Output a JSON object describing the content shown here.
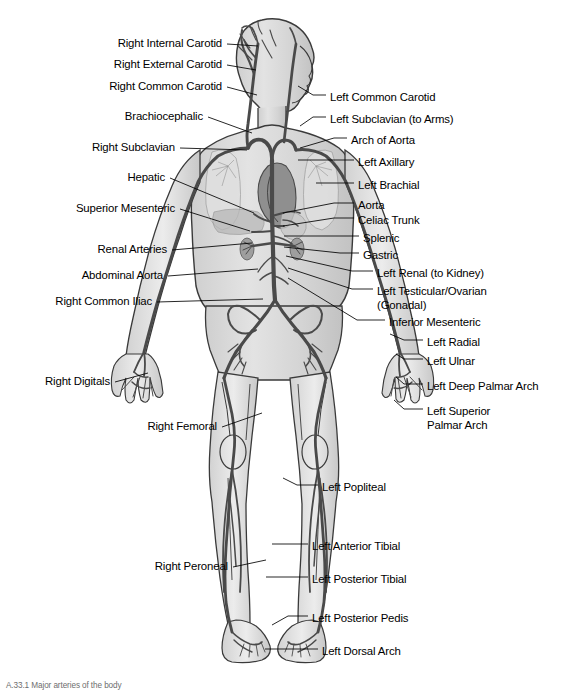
{
  "figure": {
    "caption": "A.33.1 Major arteries of the body",
    "colors": {
      "background": "#ffffff",
      "body_fill": "#d8d8d8",
      "body_fill_light": "#e8e8e8",
      "body_outline": "#3a3a3a",
      "artery": "#4a4a4a",
      "artery_dark": "#333333",
      "heart": "#8a8a8a",
      "leader_line": "#000000",
      "text": "#000000"
    }
  },
  "labels_left": [
    {
      "id": "right-internal-carotid",
      "text": "Right Internal Carotid",
      "x": 222,
      "y": 37,
      "lead_x2": 258,
      "lead_y2": 46
    },
    {
      "id": "right-external-carotid",
      "text": "Right External Carotid",
      "x": 222,
      "y": 58,
      "lead_x2": 256,
      "lead_y2": 70
    },
    {
      "id": "right-common-carotid",
      "text": "Right Common Carotid",
      "x": 222,
      "y": 80,
      "lead_x2": 257,
      "lead_y2": 95
    },
    {
      "id": "brachiocephalic",
      "text": "Brachiocephalic",
      "x": 203,
      "y": 110,
      "lead_x2": 252,
      "lead_y2": 133
    },
    {
      "id": "right-subclavian",
      "text": "Right Subclavian",
      "x": 175,
      "y": 141,
      "lead_x2": 247,
      "lead_y2": 150
    },
    {
      "id": "hepatic",
      "text": "Hepatic",
      "x": 165,
      "y": 171,
      "lead_x2": 254,
      "lead_y2": 213
    },
    {
      "id": "superior-mesenteric",
      "text": "Superior Mesenteric",
      "x": 175,
      "y": 202,
      "lead_x2": 250,
      "lead_y2": 231
    },
    {
      "id": "renal-arteries",
      "text": "Renal Arteries",
      "x": 167,
      "y": 243,
      "lead_x2": 252,
      "lead_y2": 243
    },
    {
      "id": "abdominal-aorta",
      "text": "Abdominal Aorta",
      "x": 163,
      "y": 269,
      "lead_x2": 258,
      "lead_y2": 269
    },
    {
      "id": "right-common-iliac",
      "text": "Right Common Iliac",
      "x": 152,
      "y": 295,
      "lead_x2": 263,
      "lead_y2": 299
    },
    {
      "id": "right-digitals",
      "text": "Right Digitals",
      "x": 110,
      "y": 375,
      "lead_x2": 148,
      "lead_y2": 373
    },
    {
      "id": "right-femoral",
      "text": "Right Femoral",
      "x": 217,
      "y": 420,
      "lead_x2": 262,
      "lead_y2": 413
    },
    {
      "id": "right-peroneal",
      "text": "Right Peroneal",
      "x": 228,
      "y": 560,
      "lead_x2": 266,
      "lead_y2": 560
    }
  ],
  "labels_right": [
    {
      "id": "left-common-carotid",
      "text": "Left Common Carotid",
      "x": 330,
      "y": 91,
      "lead_x1": 313,
      "lead_y1": 95,
      "anchor_x": 298,
      "anchor_y": 86
    },
    {
      "id": "left-subclavian",
      "text": "Left Subclavian (to Arms)",
      "x": 330,
      "y": 113,
      "lead_x1": 313,
      "lead_y1": 117,
      "anchor_x": 300,
      "anchor_y": 126
    },
    {
      "id": "arch-of-aorta",
      "text": "Arch of Aorta",
      "x": 351,
      "y": 134,
      "lead_x1": 334,
      "lead_y1": 138,
      "anchor_x": 300,
      "anchor_y": 148
    },
    {
      "id": "left-axillary",
      "text": "Left Axillary",
      "x": 358,
      "y": 156,
      "lead_x1": 328,
      "lead_y1": 160,
      "anchor_x": 298,
      "anchor_y": 160
    },
    {
      "id": "left-brachial",
      "text": "Left Brachial",
      "x": 358,
      "y": 179,
      "lead_x1": 334,
      "lead_y1": 183,
      "anchor_x": 316,
      "anchor_y": 183
    },
    {
      "id": "aorta",
      "text": "Aorta",
      "x": 358,
      "y": 199,
      "lead_x1": 334,
      "lead_y1": 203,
      "anchor_x": 283,
      "anchor_y": 213
    },
    {
      "id": "celiac-trunk",
      "text": "Celiac Trunk",
      "x": 358,
      "y": 214,
      "lead_x1": 334,
      "lead_y1": 218,
      "anchor_x": 283,
      "anchor_y": 226
    },
    {
      "id": "splenic",
      "text": "Splenic",
      "x": 363,
      "y": 232,
      "lead_x1": 340,
      "lead_y1": 236,
      "anchor_x": 284,
      "anchor_y": 236
    },
    {
      "id": "gastric",
      "text": "Gastric",
      "x": 363,
      "y": 249,
      "lead_x1": 340,
      "lead_y1": 253,
      "anchor_x": 284,
      "anchor_y": 247
    },
    {
      "id": "left-renal",
      "text": "Left Renal (to Kidney)",
      "x": 377,
      "y": 267,
      "lead_x1": 352,
      "lead_y1": 271,
      "anchor_x": 286,
      "anchor_y": 256
    },
    {
      "id": "left-testicular-ovarian",
      "text": "Left Testicular/Ovarian",
      "text2": "(Gonadal)",
      "x": 377,
      "y": 285,
      "lead_x1": 352,
      "lead_y1": 289,
      "anchor_x": 288,
      "anchor_y": 268
    },
    {
      "id": "inferior-mesenteric",
      "text": "Inferior Mesenteric",
      "x": 389,
      "y": 316,
      "lead_x1": 357,
      "lead_y1": 320,
      "anchor_x": 288,
      "anchor_y": 278
    },
    {
      "id": "left-radial",
      "text": "Left Radial",
      "x": 427,
      "y": 336,
      "lead_x1": 404,
      "lead_y1": 340,
      "anchor_x": 390,
      "anchor_y": 334
    },
    {
      "id": "left-ulnar",
      "text": "Left Ulnar",
      "x": 427,
      "y": 355,
      "lead_x1": 404,
      "lead_y1": 359,
      "anchor_x": 396,
      "anchor_y": 354
    },
    {
      "id": "left-deep-palmar-arch",
      "text": "Left Deep Palmar Arch",
      "x": 427,
      "y": 380,
      "lead_x1": 404,
      "lead_y1": 384,
      "anchor_x": 396,
      "anchor_y": 377
    },
    {
      "id": "left-superior-palmar-arch",
      "text": "Left Superior",
      "text2": "Palmar Arch",
      "x": 427,
      "y": 405,
      "lead_x1": 404,
      "lead_y1": 409,
      "anchor_x": 394,
      "anchor_y": 400
    },
    {
      "id": "left-popliteal",
      "text": "Left Popliteal",
      "x": 322,
      "y": 481,
      "lead_x1": 297,
      "lead_y1": 485,
      "anchor_x": 283,
      "anchor_y": 478
    },
    {
      "id": "left-anterior-tibial",
      "text": "Left Anterior Tibial",
      "x": 312,
      "y": 540,
      "lead_x1": 288,
      "lead_y1": 544,
      "anchor_x": 272,
      "anchor_y": 544
    },
    {
      "id": "left-posterior-tibial",
      "text": "Left Posterior Tibial",
      "x": 312,
      "y": 573,
      "lead_x1": 282,
      "lead_y1": 577,
      "anchor_x": 266,
      "anchor_y": 577
    },
    {
      "id": "left-posterior-pedis",
      "text": "Left Posterior Pedis",
      "x": 312,
      "y": 612,
      "lead_x1": 288,
      "lead_y1": 616,
      "anchor_x": 272,
      "anchor_y": 625
    },
    {
      "id": "left-dorsal-arch",
      "text": "Left Dorsal Arch",
      "x": 322,
      "y": 645,
      "lead_x1": 287,
      "lead_y1": 649,
      "anchor_x": 265,
      "anchor_y": 649
    }
  ]
}
